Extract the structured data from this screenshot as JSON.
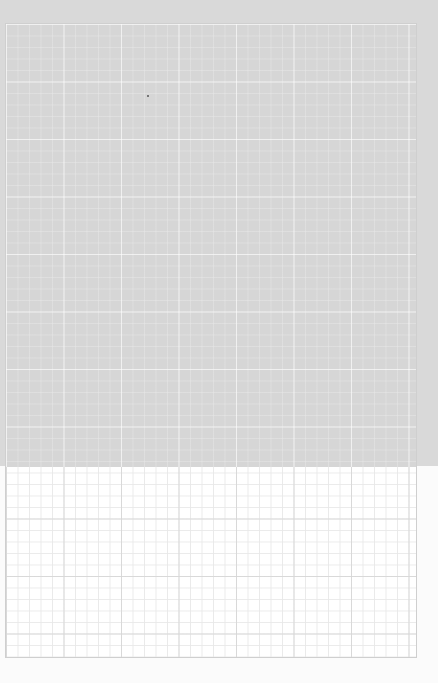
{
  "image": {
    "description": "Photograph of a sheet of square-grid graph paper, upper portion shaded gray, lower portion bright white",
    "grid": {
      "cell_size_px": 11.5,
      "major_every_cells": 5,
      "top_tone": "#d6d6d6",
      "bottom_tone": "#ffffff"
    },
    "specks": [
      {
        "x": 147,
        "y": 95
      }
    ]
  }
}
